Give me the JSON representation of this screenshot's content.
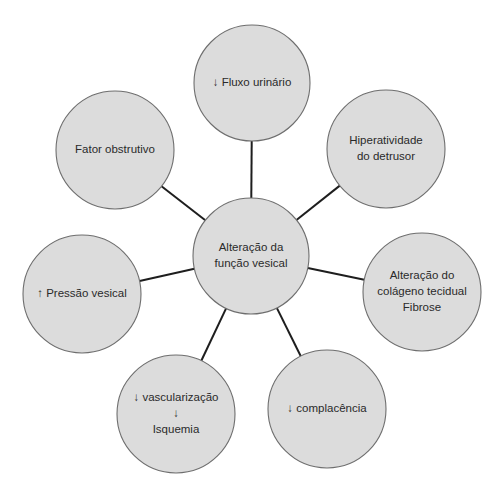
{
  "diagram": {
    "type": "radial-concept-map",
    "colors": {
      "node_fill": "#dcdcdc",
      "node_stroke": "#6e6e6e",
      "edge": "#1e1e1e",
      "text": "#2a2a2a",
      "background": "#ffffff"
    },
    "center": {
      "id": "center",
      "cx": 251,
      "cy": 256,
      "r": 58,
      "lines": [
        "Alteração da",
        "função vesical"
      ]
    },
    "nodes": [
      {
        "id": "fluxo",
        "cx": 252,
        "cy": 83,
        "r": 58,
        "lines": [
          "↓ Fluxo urinário"
        ]
      },
      {
        "id": "hiperatividade",
        "cx": 386,
        "cy": 149,
        "r": 59,
        "lines": [
          "Hiperatividade",
          "do detrusor"
        ]
      },
      {
        "id": "colageno",
        "cx": 422,
        "cy": 292,
        "r": 59,
        "lines": [
          "Alteração do",
          "colágeno tecidual",
          "Fibrose"
        ]
      },
      {
        "id": "complacencia",
        "cx": 327,
        "cy": 409,
        "r": 59,
        "lines": [
          "↓ complacência"
        ]
      },
      {
        "id": "vascularizacao",
        "cx": 176,
        "cy": 414,
        "r": 59,
        "lines": [
          "↓ vascularização",
          "↓",
          "Isquemia"
        ]
      },
      {
        "id": "pressao",
        "cx": 82,
        "cy": 294,
        "r": 59,
        "lines": [
          "↑ Pressão vesical"
        ]
      },
      {
        "id": "fator",
        "cx": 115,
        "cy": 150,
        "r": 59,
        "lines": [
          "Fator obstrutivo"
        ]
      }
    ]
  }
}
